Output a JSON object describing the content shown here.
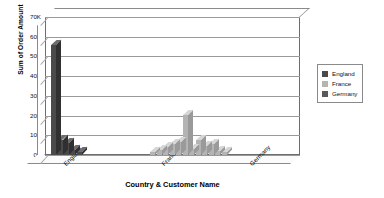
{
  "chart_data": {
    "type": "bar",
    "title": "",
    "subtitle": "",
    "xlabel": "Country & Customer Name",
    "ylabel": "Sum of Order Amount",
    "ylim": [
      0,
      70000
    ],
    "ytick_labels": [
      "0K",
      "10K",
      "20K",
      "30K",
      "40K",
      "50K",
      "60K",
      "70K"
    ],
    "ytick_values": [
      0,
      10000,
      20000,
      30000,
      40000,
      50000,
      60000,
      70000
    ],
    "grid": true,
    "grid_axis": "y",
    "style": "3d-column",
    "legend_position": "right",
    "categories": [
      "England",
      "France",
      "Germany"
    ],
    "series": [
      {
        "name": "England",
        "color": "#4a4a4a",
        "values": [
          56000,
          0,
          0
        ]
      },
      {
        "name": "France",
        "color": "#b4b4b4",
        "values": [
          0,
          20500,
          0
        ]
      },
      {
        "name": "Germany",
        "color": "#595959",
        "values": [
          0,
          0,
          65000
        ]
      }
    ],
    "customer_bars": [
      {
        "group": "England",
        "series": "England",
        "value": 56000
      },
      {
        "group": "England",
        "series": "England",
        "value": 7800
      },
      {
        "group": "England",
        "series": "England",
        "value": 6200
      },
      {
        "group": "England",
        "series": "England",
        "value": 2600
      },
      {
        "group": "England",
        "series": "England",
        "value": 1400
      },
      {
        "group": "France",
        "series": "France",
        "value": 1500
      },
      {
        "group": "France",
        "series": "France",
        "value": 2600
      },
      {
        "group": "France",
        "series": "France",
        "value": 4200
      },
      {
        "group": "France",
        "series": "France",
        "value": 5600
      },
      {
        "group": "France",
        "series": "France",
        "value": 6400
      },
      {
        "group": "France",
        "series": "France",
        "value": 20500
      },
      {
        "group": "France",
        "series": "France",
        "value": 3000
      },
      {
        "group": "France",
        "series": "France",
        "value": 7600
      },
      {
        "group": "France",
        "series": "France",
        "value": 4400
      },
      {
        "group": "France",
        "series": "France",
        "value": 5800
      },
      {
        "group": "France",
        "series": "France",
        "value": 2200
      },
      {
        "group": "France",
        "series": "France",
        "value": 1300
      },
      {
        "group": "Germany",
        "series": "Germany",
        "value": 65000
      }
    ]
  },
  "legend": {
    "items": [
      {
        "label": "England",
        "color": "#4a4a4a"
      },
      {
        "label": "France",
        "color": "#b4b4b4"
      },
      {
        "label": "Germany",
        "color": "#595959"
      }
    ]
  },
  "axes": {
    "y_title": "Sum of Order Amount",
    "x_title": "Country & Customer Name"
  }
}
